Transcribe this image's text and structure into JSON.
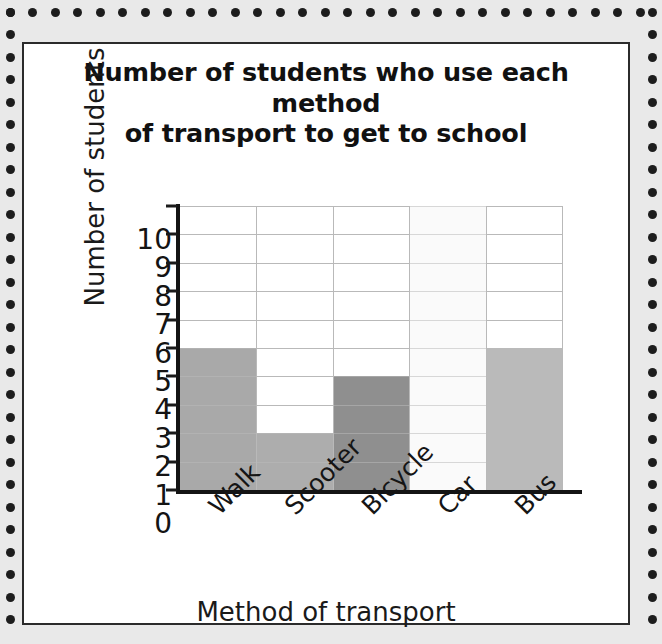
{
  "card": {
    "title_line1": "Number of students who use each method",
    "title_line2": "of transport to get to school"
  },
  "chart_data": {
    "type": "bar",
    "title": "Number of students who use each method of transport to get to school",
    "xlabel": "Method of transport",
    "ylabel": "Number of students",
    "categories": [
      "Walk",
      "Scooter",
      "Bicycle",
      "Car",
      "Bus"
    ],
    "values": [
      5,
      2,
      4,
      10,
      5
    ],
    "bar_colors": [
      "#a9a9a9",
      "#adadad",
      "#8f8f8f",
      "#fafafa",
      "#bababa"
    ],
    "ylim": [
      0,
      10
    ],
    "ytick_labels": [
      "0",
      "1",
      "2",
      "3",
      "4",
      "5",
      "6",
      "7",
      "8",
      "9",
      "10"
    ],
    "ytick_values": [
      0,
      1,
      2,
      3,
      4,
      5,
      6,
      7,
      8,
      9,
      10
    ],
    "grid": true,
    "grid_color": "#b9b9b9",
    "axis_color": "#141414",
    "legend": null,
    "bar_gap": 0
  },
  "style": {
    "page_background": "#e9e9e9",
    "card_background": "#ffffff",
    "card_border": "#2b2b2b",
    "dot_color": "#1d1d1d"
  }
}
